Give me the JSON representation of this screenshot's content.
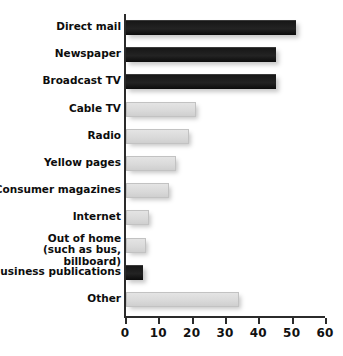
{
  "chart_data": {
    "type": "bar",
    "orientation": "horizontal",
    "title": "",
    "xlabel": "",
    "ylabel": "",
    "xlim": [
      0,
      60
    ],
    "xticks": [
      0,
      10,
      20,
      30,
      40,
      50,
      60
    ],
    "xtick_labels": [
      "0",
      "10",
      "20",
      "30",
      "40",
      "50",
      "60"
    ],
    "grid": false,
    "legend": "none",
    "categories": [
      "Direct mail",
      "Newspaper",
      "Broadcast TV",
      "Cable TV",
      "Radio",
      "Yellow pages",
      "Consumer magazines",
      "Internet",
      "Out of home\n(such as bus, billboard)",
      "Business publications",
      "Other"
    ],
    "values": [
      51,
      45,
      45,
      21,
      19,
      15,
      13,
      7,
      6,
      5,
      34
    ],
    "bar_styles": [
      "dark",
      "dark",
      "dark",
      "light",
      "light",
      "light",
      "light",
      "light",
      "light",
      "dark",
      "light"
    ],
    "colors": {
      "dark_bar": "#1a1a1a",
      "light_bar": "#dcdcdc",
      "light_bar_border": "#c2c2c2",
      "axis": "#2b2b2b",
      "text": "#0d0d0d",
      "background": "#ffffff"
    }
  }
}
